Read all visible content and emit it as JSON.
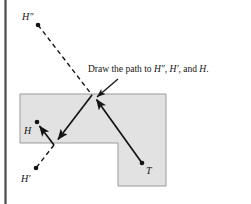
{
  "figure": {
    "caption": {
      "prefix": "Draw the path to ",
      "target_1": "H″",
      "sep_1": ", ",
      "target_2": "H′",
      "sep_2": ", and ",
      "target_3": "H",
      "suffix": "."
    },
    "labels": {
      "h_double_prime": "H″",
      "h_prime": "H′",
      "h": "H",
      "t": "T"
    },
    "colors": {
      "region_fill": "#e2e2e2",
      "region_stroke": "#9a9a9a",
      "ink": "#141414",
      "rule": "#4a4a4a",
      "background": "#ffffff"
    },
    "geometry": {
      "left_rule_x": 5,
      "region_outline": "20,94 166,94 166,186 118,186 118,143 20,143",
      "points": {
        "h_double_prime": [
          38,
          25
        ],
        "h_prime": [
          36,
          168
        ],
        "h": [
          37,
          122
        ],
        "t": [
          142,
          163
        ],
        "bounce_top": [
          92,
          95
        ],
        "bounce_left": [
          54,
          145
        ]
      },
      "dashed_paths": [
        "38,25 92,95",
        "54,145 36,168"
      ],
      "solid_paths": [
        "142,163 92,95",
        "92,95 54,145",
        "54,145 37,122"
      ],
      "caption_arrow": "118,79 96,98"
    }
  }
}
